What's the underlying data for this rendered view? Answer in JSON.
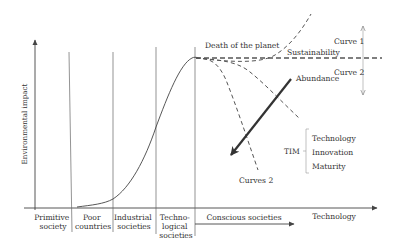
{
  "axes": {
    "y_label": "Environmental impact",
    "x_label": "Technology"
  },
  "eras": [
    {
      "id": "primitive",
      "lines": [
        "Primitive",
        "society"
      ]
    },
    {
      "id": "poor",
      "lines": [
        "Poor",
        "countries"
      ]
    },
    {
      "id": "industrial",
      "lines": [
        "Industrial",
        "societies"
      ]
    },
    {
      "id": "technological",
      "lines": [
        "Techno-",
        "logical",
        "societies"
      ]
    }
  ],
  "conscious": {
    "label": "Conscious societies"
  },
  "annotations": {
    "death": "Death of the planet",
    "sustainability": "Sustainability",
    "abundance": "Abundance",
    "curve1": "Curve 1",
    "curve2": "Curve 2",
    "curves2": "Curves 2"
  },
  "tim": {
    "abbr": "TIM",
    "items": [
      "Technology",
      "Innovation",
      "Maturity"
    ]
  },
  "colors": {
    "line": "#444444",
    "text": "#333333",
    "background": "#ffffff"
  }
}
